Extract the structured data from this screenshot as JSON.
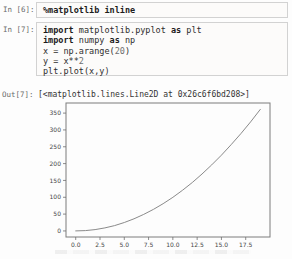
{
  "cells": [
    {
      "prompt": "In [6]:",
      "lines": [
        [
          {
            "t": "%matplotlib inline",
            "b": true
          }
        ]
      ]
    },
    {
      "prompt": "In [7]:",
      "lines": [
        [
          {
            "t": "import",
            "b": true
          },
          {
            "t": " matplotlib.pyplot "
          },
          {
            "t": "as",
            "b": true
          },
          {
            "t": " plt"
          }
        ],
        [
          {
            "t": "import",
            "b": true
          },
          {
            "t": " numpy "
          },
          {
            "t": "as",
            "b": true
          },
          {
            "t": " np"
          }
        ],
        [
          {
            "t": "x = np.arange("
          },
          {
            "t": "20",
            "num": true
          },
          {
            "t": ")"
          }
        ],
        [
          {
            "t": "y = x**"
          },
          {
            "t": "2",
            "num": true
          }
        ],
        [
          {
            "t": "plt.plot(x,y)"
          }
        ]
      ]
    }
  ],
  "output": {
    "prompt": "Out[7]:",
    "text": "[<matplotlib.lines.Line2D at 0x26c6f6bd208>]"
  },
  "chart_data": {
    "type": "line",
    "title": "",
    "xlabel": "",
    "ylabel": "",
    "x": [
      0,
      1,
      2,
      3,
      4,
      5,
      6,
      7,
      8,
      9,
      10,
      11,
      12,
      13,
      14,
      15,
      16,
      17,
      18,
      19
    ],
    "y": [
      0,
      1,
      4,
      9,
      16,
      25,
      36,
      49,
      64,
      81,
      100,
      121,
      144,
      169,
      196,
      225,
      256,
      289,
      324,
      361
    ],
    "xlim": [
      -1,
      20
    ],
    "ylim": [
      -18,
      380
    ],
    "xticks": [
      0,
      2.5,
      5,
      7.5,
      10,
      12.5,
      15,
      17.5
    ],
    "xtick_labels": [
      "0.0",
      "2.5",
      "5.0",
      "7.5",
      "10.0",
      "12.5",
      "15.0",
      "17.5"
    ],
    "yticks": [
      0,
      50,
      100,
      150,
      200,
      250,
      300,
      350
    ],
    "ytick_labels": [
      "0",
      "50",
      "100",
      "150",
      "200",
      "250",
      "300",
      "350"
    ],
    "grid": false,
    "legend": "none"
  },
  "colors": {
    "axis": "#7d7d7d",
    "tick": "#6f6f6f",
    "tick_label": "#454545",
    "line": "#8a8a8a",
    "code_text": "#2e2e2e",
    "prompt_text": "#6b6b6b",
    "cell_border": "#d2d2d2"
  }
}
